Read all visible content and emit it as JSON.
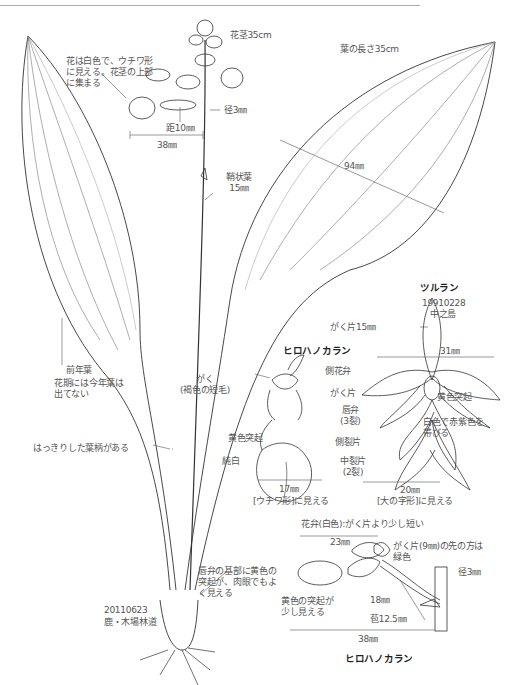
{
  "plant_main": {
    "flower_text": "花は白色で、ウチワ形\nに見える。花茎の上部\nに集まる",
    "scape_length": "花茎35cm",
    "spur_diameter": "径3㎜",
    "spur_length": "距10㎜",
    "flower_width": "38㎜",
    "sheath_leaf": "鞘状葉\n15㎜",
    "leaf_length": "葉の長さ35cm",
    "leaf_width": "94㎜",
    "prev_leaf": "前年葉",
    "prev_leaf_note": "花期には今年葉は\n出てない",
    "petiole": "はっきりした葉柄がある",
    "lip_base_note": "唇弁の基部に黄色の\n突起が、肉眼でもよ\nく見える",
    "specimen_date": "20110623",
    "specimen_place": "鹿・木場林道"
  },
  "tsururan": {
    "title": "ツルラン",
    "date": "19910228",
    "place": "中之島",
    "sepal": "がく片15㎜",
    "width": "31㎜",
    "yellow_bump": "黄色突起",
    "color_note": "白色で赤紫色を\n帯びる",
    "lip_width": "20㎜",
    "lip_shape": "[大の字形]に見える"
  },
  "hirohanokaran": {
    "title": "ヒロハノカラン",
    "sepal_hair": "がく\n(褐色の短毛)",
    "lateral_petal": "側花弁",
    "sepal": "がく片",
    "lip": "唇弁\n(3裂)",
    "yellow_bump": "黄色突起",
    "lateral_lobe": "側裂片",
    "pure_white": "純白",
    "middle_lobe": "中裂片\n(2裂)",
    "lip_width": "17㎜",
    "lip_shape": "[ウチワ形]に見える"
  },
  "side_view": {
    "title": "ヒロハノカラン",
    "petal_note": "花弁(白色):がく片より少し短い",
    "petal_length": "23㎜",
    "sepal_note": "がく片(9㎜)の先の方は\n緑色",
    "stem_diameter": "径3㎜",
    "yellow_note": "黄色の突起が\n少し見える",
    "spur": "18㎜",
    "pedicel": "苞12.5㎜",
    "total": "38㎜"
  }
}
